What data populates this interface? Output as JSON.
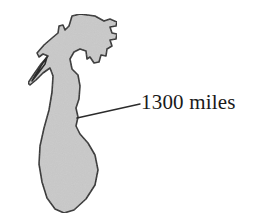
{
  "figure": {
    "type": "labeled-silhouette-diagram",
    "background_color": "#ffffff",
    "shape": {
      "name": "lake-silhouette",
      "fill_color": "#c9c9c9",
      "outline_color": "#2b2b2b",
      "outline_width": 1.6,
      "bounds": {
        "x": 28,
        "y": 14,
        "width": 98,
        "height": 200
      },
      "path": "M 72,16 L 80,14 L 95,16 L 104,21 L 110,19 L 117,22 L 116,26 L 110,27 L 112,33 L 117,34 L 116,39 L 110,40 L 112,46 L 107,49 L 106,56 L 101,55 L 99,62 L 94,63 L 90,57 L 87,59 L 86,51 L 80,49 L 74,52 L 70,59 L 72,69 L 78,75 L 80,86 L 79,99 L 76,108 L 78,117 L 76,126 L 80,134 L 88,143 L 95,155 L 98,170 L 95,185 L 86,199 L 74,210 L 64,213 L 55,209 L 47,198 L 42,182 L 39,164 L 40,146 L 44,128 L 49,110 L 52,92 L 53,76 L 50,68 L 43,73 L 36,80 L 30,85 L 28,83 L 34,74 L 41,64 L 48,56 L 43,54 L 39,57 L 37,53 L 44,45 L 52,38 L 58,33 L 59,26 L 63,25 L 65,30 L 69,26 Z",
      "inner_notch_path": "M 47,57 L 41,66 L 36,74 L 32,81 L 39,72 L 45,64 Z"
    },
    "leader_line": {
      "name": "callout-leader-line",
      "color": "#2b2b2b",
      "width": 1.5,
      "from": {
        "x": 77,
        "y": 118
      },
      "to": {
        "x": 140,
        "y": 104
      }
    },
    "label": {
      "text": "1300 miles",
      "color": "#1a1a1a",
      "x": 141,
      "y": 90
    }
  }
}
